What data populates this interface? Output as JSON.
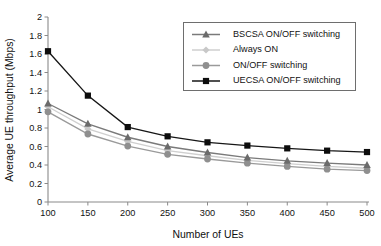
{
  "chart_data": {
    "type": "line",
    "title": "",
    "xlabel": "Number of UEs",
    "ylabel": "Average UE throughput (Mbps)",
    "x": [
      100,
      150,
      200,
      250,
      300,
      350,
      400,
      450,
      500
    ],
    "xtick_labels": [
      "100",
      "150",
      "200",
      "250",
      "300",
      "350",
      "400",
      "450",
      "500"
    ],
    "ytick_labels": [
      "0",
      "0.2",
      "0.4",
      "0.6",
      "0.8",
      "1",
      "1.2",
      "1.4",
      "1.6",
      "1.8",
      "2"
    ],
    "ytick_values": [
      0,
      0.2,
      0.4,
      0.6,
      0.8,
      1,
      1.2,
      1.4,
      1.6,
      1.8,
      2
    ],
    "xlim": [
      100,
      500
    ],
    "ylim": [
      0,
      2
    ],
    "grid": false,
    "legend_position": "upper-right-inside",
    "series": [
      {
        "name": "BSCSA ON/OFF switching",
        "marker": "triangle",
        "color": "#6b6b6b",
        "line_color": "#7a7a7a",
        "values": [
          1.065,
          0.845,
          0.7,
          0.6,
          0.535,
          0.48,
          0.445,
          0.42,
          0.4
        ]
      },
      {
        "name": "Always ON",
        "marker": "diamond",
        "color": "#c8c8c8",
        "line_color": "#cfcfcf",
        "values": [
          1.03,
          0.79,
          0.655,
          0.555,
          0.5,
          0.45,
          0.415,
          0.385,
          0.365
        ]
      },
      {
        "name": "ON/OFF switching",
        "marker": "circle",
        "color": "#8f8f8f",
        "line_color": "#9a9a9a",
        "values": [
          0.975,
          0.735,
          0.605,
          0.515,
          0.465,
          0.42,
          0.385,
          0.355,
          0.34
        ]
      },
      {
        "name": "UECSA ON/OFF switching",
        "marker": "square",
        "color": "#0d0d0d",
        "line_color": "#161616",
        "values": [
          1.63,
          1.15,
          0.81,
          0.71,
          0.645,
          0.61,
          0.58,
          0.555,
          0.54
        ]
      }
    ]
  },
  "legend": {
    "entries": [
      "BSCSA ON/OFF switching",
      "Always ON",
      "ON/OFF switching",
      "UECSA ON/OFF switching"
    ]
  },
  "colors": {
    "background": "#ffffff",
    "axis": "#8a8a8a",
    "text": "#121212"
  }
}
